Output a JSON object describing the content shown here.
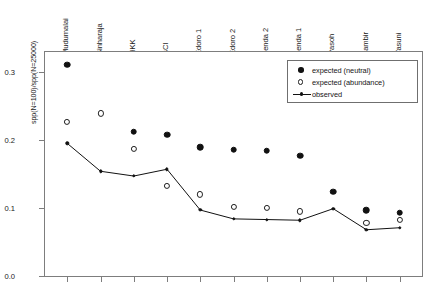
{
  "chart_data": {
    "type": "scatter",
    "title": "",
    "xlabel": "",
    "ylabel": "spp(N=100)/spp(N=25000)",
    "ylim": [
      0.0,
      0.333
    ],
    "y_ticks": [
      "0.0",
      "0.1",
      "0.2",
      "0.3"
    ],
    "y_tick_values": [
      0.0,
      0.1,
      0.2,
      0.3
    ],
    "grid": false,
    "legend_position": "top-right",
    "categories": [
      "Mudumalai",
      "Sinharaja",
      "HKK",
      "BCI",
      "Edoro 1",
      "Edoro 2",
      "Lenda 2",
      "Lenda 1",
      "Pasoh",
      "Lambir",
      "Yasuni"
    ],
    "series": [
      {
        "name": "expected (neutral)",
        "marker": "filled-circle",
        "line": false,
        "color": "#111111",
        "values": [
          0.311,
          null,
          0.212,
          0.208,
          0.189,
          0.186,
          0.184,
          0.177,
          0.124,
          0.097,
          0.093
        ]
      },
      {
        "name": "expected (abundance)",
        "marker": "open-circle",
        "line": false,
        "color": "#1c1c1c",
        "values": [
          0.227,
          0.239,
          0.187,
          0.133,
          0.12,
          0.102,
          0.1,
          0.095,
          null,
          0.078,
          0.083
        ]
      },
      {
        "name": "observed",
        "marker": "small-filled-circle",
        "line": true,
        "color": "#111111",
        "values": [
          0.195,
          0.154,
          0.147,
          0.157,
          0.097,
          0.084,
          0.083,
          0.082,
          0.099,
          0.068,
          0.071
        ]
      }
    ]
  },
  "legend": {
    "items": [
      {
        "label": "expected (neutral)",
        "key": "filled-circle-key"
      },
      {
        "label": "expected (abundance)",
        "key": "open-circle-key"
      },
      {
        "label": "observed",
        "key": "line-marker-key"
      }
    ]
  },
  "axes": {
    "y_title": "spp(N=100)/spp(N=25000)"
  }
}
